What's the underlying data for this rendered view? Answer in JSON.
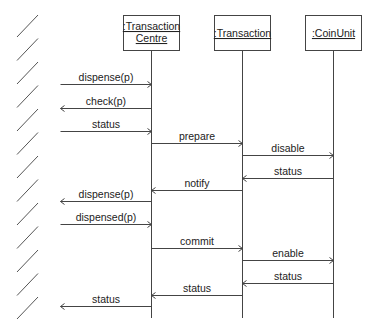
{
  "diagram": {
    "type": "UML sequence diagram",
    "boundary": {
      "kind": "external actor (hatched wall)",
      "hatch_count": 13
    },
    "objects": [
      {
        "id": "tc",
        "label_lines": [
          ":Transaction",
          "Centre"
        ],
        "x": 151
      },
      {
        "id": "tr",
        "label_lines": [
          ":Transaction"
        ],
        "x": 242
      },
      {
        "id": "cu",
        "label_lines": [
          ":CoinUnit"
        ],
        "x": 333
      }
    ],
    "messages": [
      {
        "label": "dispense(p)",
        "from": "env",
        "to": "tc",
        "y": 84
      },
      {
        "label": "check(p)",
        "from": "tc",
        "to": "env",
        "y": 108
      },
      {
        "label": "status",
        "from": "env",
        "to": "tc",
        "y": 131
      },
      {
        "label": "prepare",
        "from": "tc",
        "to": "tr",
        "y": 143
      },
      {
        "label": "disable",
        "from": "tr",
        "to": "cu",
        "y": 155
      },
      {
        "label": "status",
        "from": "cu",
        "to": "tr",
        "y": 178
      },
      {
        "label": "notify",
        "from": "tr",
        "to": "tc",
        "y": 190
      },
      {
        "label": "dispense(p)",
        "from": "tc",
        "to": "env",
        "y": 201
      },
      {
        "label": "dispensed(p)",
        "from": "env",
        "to": "tc",
        "y": 224
      },
      {
        "label": "commit",
        "from": "tc",
        "to": "tr",
        "y": 248
      },
      {
        "label": "enable",
        "from": "tr",
        "to": "cu",
        "y": 260
      },
      {
        "label": "status",
        "from": "cu",
        "to": "tr",
        "y": 283
      },
      {
        "label": "status",
        "from": "tr",
        "to": "tc",
        "y": 295
      },
      {
        "label": "status",
        "from": "tc",
        "to": "env",
        "y": 306
      }
    ]
  }
}
